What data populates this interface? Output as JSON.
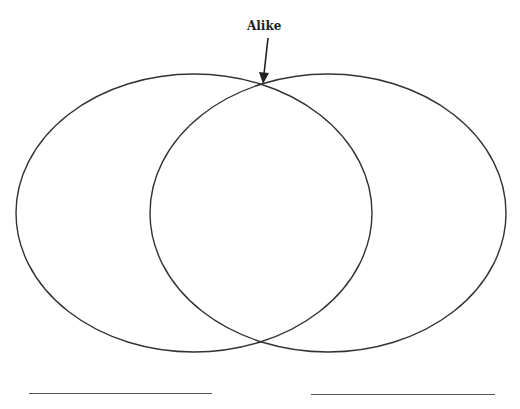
{
  "diagram": {
    "type": "venn",
    "annotation": {
      "label": "Alike",
      "points_to": "top intersection of circles"
    },
    "circles": [
      {
        "name": "left-set",
        "label": ""
      },
      {
        "name": "right-set",
        "label": ""
      }
    ],
    "answer_lines": [
      {
        "name": "left-set-label-line",
        "value": ""
      },
      {
        "name": "right-set-label-line",
        "value": ""
      }
    ],
    "stroke_color": "#333333"
  }
}
